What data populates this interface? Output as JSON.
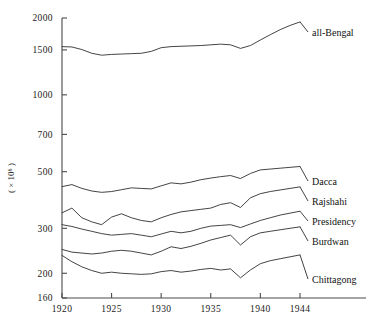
{
  "chart_data": {
    "type": "line",
    "title": "",
    "xlabel": "",
    "ylabel": "( × 10⁶ )",
    "yscale": "log",
    "ylim": [
      160,
      2000
    ],
    "xlim": [
      1920,
      1944
    ],
    "grid": false,
    "legend_position": "right-inline-labels",
    "yticks": [
      160,
      200,
      300,
      500,
      700,
      1000,
      1500,
      2000
    ],
    "ytick_labels": [
      "160",
      "200",
      "300",
      "500",
      "700",
      "1000",
      "1500",
      "2000"
    ],
    "xticks": [
      1920,
      1925,
      1930,
      1935,
      1940,
      1944
    ],
    "xtick_labels": [
      "1920",
      "1925",
      "1930",
      "1935",
      "1940",
      "1944"
    ],
    "x": [
      1920,
      1921,
      1922,
      1923,
      1924,
      1925,
      1926,
      1927,
      1928,
      1929,
      1930,
      1931,
      1932,
      1933,
      1934,
      1935,
      1936,
      1937,
      1938,
      1939,
      1940,
      1941,
      1942,
      1943,
      1944
    ],
    "series": [
      {
        "name": "all-Bengal",
        "label": "all-Bengal",
        "values": [
          1545,
          1540,
          1505,
          1455,
          1430,
          1440,
          1445,
          1450,
          1455,
          1480,
          1530,
          1545,
          1550,
          1555,
          1560,
          1570,
          1580,
          1570,
          1520,
          1560,
          1640,
          1720,
          1800,
          1870,
          1930
        ]
      },
      {
        "name": "Dacca",
        "label": "Dacca",
        "values": [
          437,
          445,
          430,
          420,
          415,
          418,
          425,
          432,
          430,
          428,
          440,
          452,
          448,
          455,
          465,
          472,
          478,
          483,
          470,
          492,
          508,
          512,
          516,
          520,
          524
        ]
      },
      {
        "name": "Rajshahi",
        "label": "Rajshahi",
        "values": [
          345,
          360,
          330,
          318,
          310,
          332,
          342,
          330,
          322,
          318,
          330,
          340,
          348,
          352,
          356,
          360,
          372,
          378,
          362,
          395,
          410,
          418,
          424,
          430,
          436
        ]
      },
      {
        "name": "Presidency",
        "label": "Presidency",
        "values": [
          310,
          305,
          298,
          292,
          286,
          282,
          284,
          286,
          282,
          278,
          285,
          292,
          288,
          292,
          300,
          306,
          308,
          310,
          302,
          312,
          322,
          330,
          338,
          344,
          350
        ]
      },
      {
        "name": "Burdwan",
        "label": "Burdwan",
        "values": [
          248,
          242,
          240,
          238,
          240,
          244,
          246,
          244,
          240,
          236,
          244,
          254,
          250,
          255,
          262,
          270,
          276,
          282,
          258,
          278,
          288,
          292,
          296,
          300,
          304
        ]
      },
      {
        "name": "Chittagong",
        "label": "Chittagong",
        "values": [
          235,
          222,
          212,
          205,
          200,
          202,
          200,
          199,
          198,
          199,
          203,
          205,
          202,
          204,
          207,
          209,
          206,
          208,
          192,
          206,
          218,
          224,
          228,
          232,
          236
        ]
      }
    ]
  },
  "axes": {
    "y_axis_title": "( × 10⁶ )"
  }
}
